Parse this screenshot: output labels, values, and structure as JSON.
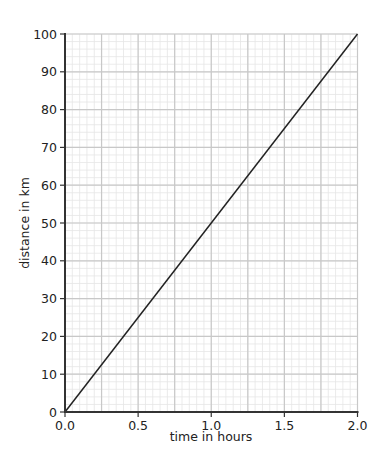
{
  "chart_data": {
    "type": "line",
    "title": "",
    "xlabel": "time in hours",
    "ylabel": "distance in km",
    "xlim": [
      0,
      2.0
    ],
    "ylim": [
      0,
      100
    ],
    "x_ticks": [
      "0.0",
      "0.5",
      "1.0",
      "1.5",
      "2.0"
    ],
    "x_tick_values": [
      0,
      0.5,
      1.0,
      1.5,
      2.0
    ],
    "y_ticks": [
      "0",
      "10",
      "20",
      "30",
      "40",
      "50",
      "60",
      "70",
      "80",
      "90",
      "100"
    ],
    "y_tick_values": [
      0,
      10,
      20,
      30,
      40,
      50,
      60,
      70,
      80,
      90,
      100
    ],
    "grid": true,
    "grid_major_x_step": 0.25,
    "grid_major_y_step": 10,
    "grid_minor_x_step": 0.05,
    "grid_minor_y_step": 2,
    "series": [
      {
        "name": "distance",
        "x": [
          0,
          2.0
        ],
        "y": [
          0,
          100
        ],
        "color": "#222222"
      }
    ]
  },
  "colors": {
    "axis": "#333333",
    "grid_major": "#c8c8c8",
    "grid_minor": "#e6e6e6",
    "line": "#222222"
  }
}
